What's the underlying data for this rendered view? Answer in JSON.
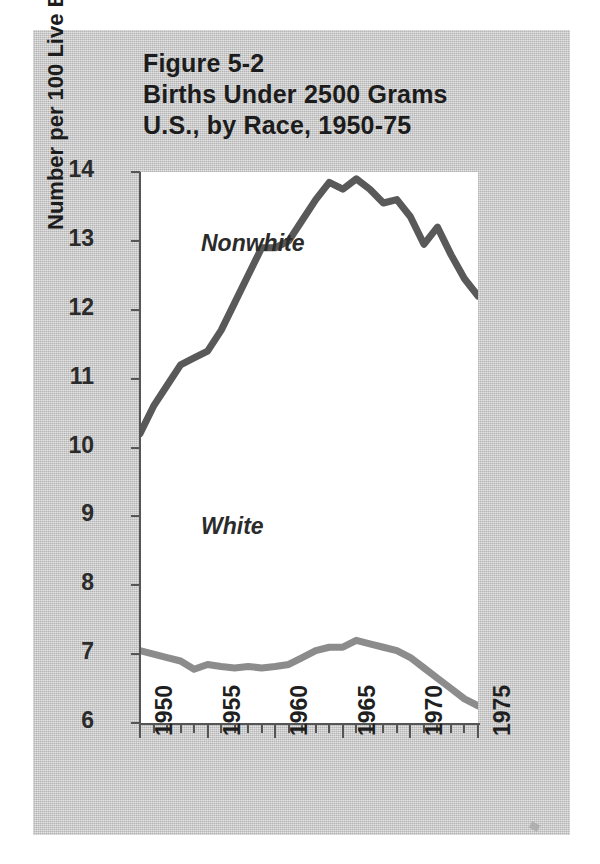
{
  "figure": {
    "title_lines": [
      "Figure 5-2",
      "Births Under 2500 Grams",
      "U.S., by Race, 1950-75"
    ],
    "panel_color": "#c9c9c9",
    "plot_background": "#ffffff"
  },
  "axes": {
    "y_title": "Number per 100 Live Births",
    "y_ticks": [
      14,
      13,
      12,
      11,
      10,
      9,
      8,
      7,
      6
    ],
    "x_major_ticks": [
      1950,
      1955,
      1960,
      1965,
      1970,
      1975
    ],
    "x_tick_labels": [
      "1950",
      "1955",
      "1960",
      "1965",
      "1970",
      "1975"
    ]
  },
  "series_labels": {
    "nonwhite": "Nonwhite",
    "white": "White"
  },
  "chart_data": {
    "type": "line",
    "title": "Figure 5-2 Births Under 2500 Grams U.S., by Race, 1950-75",
    "xlabel": "",
    "ylabel": "Number per 100 Live Births",
    "xlim": [
      1950,
      1975
    ],
    "ylim": [
      6,
      14
    ],
    "grid": false,
    "legend": "inline-annotations",
    "x": [
      1950,
      1951,
      1952,
      1953,
      1954,
      1955,
      1956,
      1957,
      1958,
      1959,
      1960,
      1961,
      1962,
      1963,
      1964,
      1965,
      1966,
      1967,
      1968,
      1969,
      1970,
      1971,
      1972,
      1973,
      1974,
      1975
    ],
    "series": [
      {
        "name": "Nonwhite",
        "color": "#595959",
        "values": [
          10.2,
          10.6,
          10.9,
          11.2,
          11.3,
          11.4,
          11.7,
          12.1,
          12.5,
          12.9,
          12.9,
          13.0,
          13.3,
          13.6,
          13.85,
          13.75,
          13.9,
          13.75,
          13.55,
          13.6,
          13.35,
          12.95,
          13.2,
          12.8,
          12.45,
          12.2
        ]
      },
      {
        "name": "White",
        "color": "#8c8c8c",
        "values": [
          7.05,
          7.0,
          6.95,
          6.9,
          6.78,
          6.85,
          6.82,
          6.8,
          6.82,
          6.8,
          6.82,
          6.85,
          6.95,
          7.05,
          7.1,
          7.1,
          7.2,
          7.15,
          7.1,
          7.05,
          6.95,
          6.8,
          6.65,
          6.5,
          6.35,
          6.25
        ]
      }
    ]
  }
}
